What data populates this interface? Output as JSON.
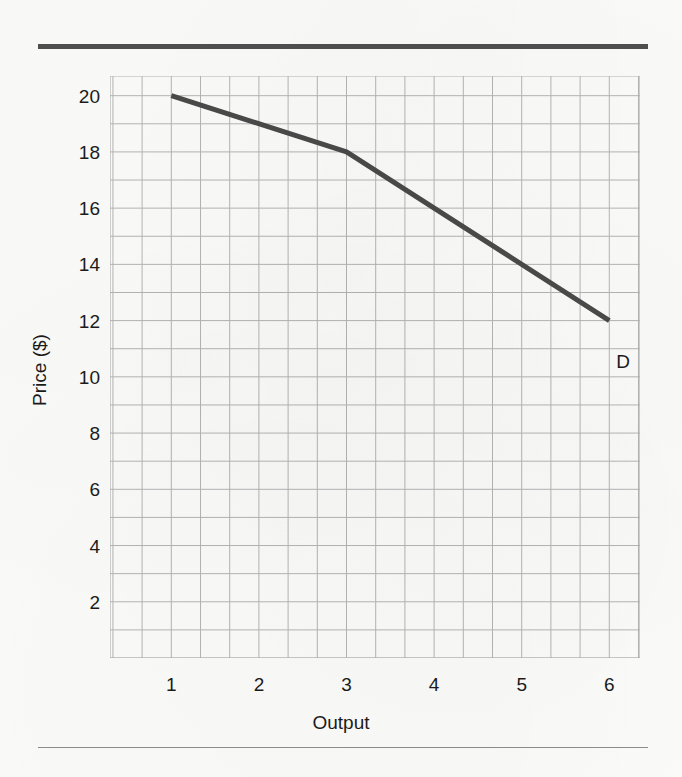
{
  "figure": {
    "background_color": "#fbfbfa",
    "rule_color": "#4f4f4f",
    "top_rule": true,
    "bottom_rule": true
  },
  "chart_data": {
    "type": "line",
    "title": "",
    "subtitle": "",
    "xlabel": "Output",
    "ylabel": "Price ($)",
    "xlim": [
      0.3,
      6.35
    ],
    "ylim": [
      0,
      20.7
    ],
    "xticks": [
      1,
      2,
      3,
      4,
      5,
      6
    ],
    "xtick_labels": [
      "1",
      "2",
      "3",
      "4",
      "5",
      "6"
    ],
    "yticks": [
      2,
      4,
      6,
      8,
      10,
      12,
      14,
      16,
      18,
      20
    ],
    "ytick_labels": [
      "2",
      "4",
      "6",
      "8",
      "10",
      "12",
      "14",
      "16",
      "18",
      "20"
    ],
    "grid": true,
    "grid_color": "#b4b4b4",
    "grid_minor_x_step": 0.3333,
    "grid_minor_y_step": 1,
    "legend": "none",
    "series": [
      {
        "name": "D",
        "label": "D",
        "color": "#4a4a4a",
        "line_width": 5,
        "x": [
          1,
          3,
          6
        ],
        "values": [
          20,
          18,
          12
        ],
        "annotation": {
          "text": "D",
          "x": 6.08,
          "y": 10.9
        }
      }
    ]
  }
}
